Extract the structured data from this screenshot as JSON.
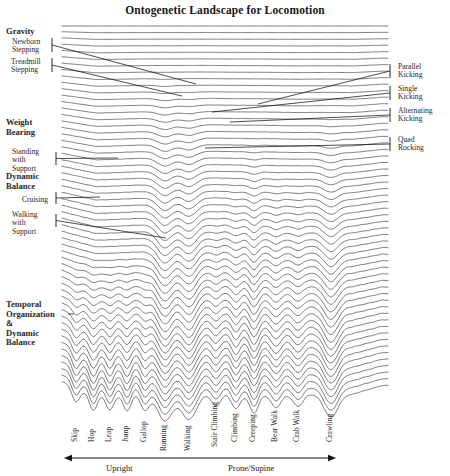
{
  "title": "Ontogenetic Landscape for Locomotion",
  "colors": {
    "line": "#2b2b2b",
    "text": "#1a1a1a",
    "background": "#ffffff",
    "leader": "#111111"
  },
  "left_annotations": [
    {
      "name": "gravity",
      "text": "Gravity",
      "bold": true,
      "x": 6,
      "y": 27,
      "bracket": false
    },
    {
      "name": "newborn-stepping",
      "text": "Newborn\nStepping",
      "bold": false,
      "x": 12,
      "y": 38,
      "bracket": true,
      "bracket_x": 52,
      "bracket_y": 38,
      "bracket_h": 14,
      "leader_to_x": 196,
      "leader_to_y": 84
    },
    {
      "name": "treadmill-stepping",
      "text": "Treadmill\nStepping",
      "bold": false,
      "x": 11,
      "y": 58,
      "bracket": true,
      "bracket_x": 52,
      "bracket_y": 58,
      "bracket_h": 14,
      "leader_to_x": 182,
      "leader_to_y": 96
    },
    {
      "name": "weight-bearing",
      "text": "Weight\nBearing",
      "bold": true,
      "x": 6,
      "y": 118,
      "bracket": false
    },
    {
      "name": "standing-with-support",
      "text": "Standing\nwith\nSupport",
      "bold": false,
      "x": 12,
      "y": 148,
      "bracket": true,
      "bracket_x": 56,
      "bracket_y": 152,
      "bracket_h": 13,
      "leader_to_x": 118,
      "leader_to_y": 158
    },
    {
      "name": "dynamic-balance",
      "text": "Dynamic\nBalance",
      "bold": true,
      "x": 6,
      "y": 172,
      "bracket": false
    },
    {
      "name": "cruising",
      "text": "Cruising",
      "bold": false,
      "x": 22,
      "y": 196,
      "bracket": true,
      "bracket_x": 56,
      "bracket_y": 192,
      "bracket_h": 12,
      "leader_to_x": 100,
      "leader_to_y": 197
    },
    {
      "name": "walking-with-support",
      "text": "Walking\nwith\nSupport",
      "bold": false,
      "x": 12,
      "y": 211,
      "bracket": true,
      "bracket_x": 56,
      "bracket_y": 214,
      "bracket_h": 13,
      "leader_to_x": 166,
      "leader_to_y": 238
    },
    {
      "name": "temporal-organization",
      "text": "Temporal\nOrganization\n&\nDynamic\nBalance",
      "bold": true,
      "x": 6,
      "y": 300,
      "bracket": false,
      "leader_to_x": 74,
      "leader_to_y": 314
    }
  ],
  "right_annotations": [
    {
      "name": "parallel-kicking",
      "text": "Parallel\nKicking",
      "x": 398,
      "y": 63,
      "bracket_x": 390,
      "bracket_y": 64,
      "bracket_h": 14,
      "leader_to_x": 258,
      "leader_to_y": 104
    },
    {
      "name": "single-kicking",
      "text": "Single\nKicking",
      "x": 398,
      "y": 85,
      "bracket_x": 390,
      "bracket_y": 86,
      "bracket_h": 14,
      "leader_to_x": 212,
      "leader_to_y": 112
    },
    {
      "name": "alternating-kicking",
      "text": "Alternating\nKicking",
      "x": 398,
      "y": 107,
      "bracket_x": 390,
      "bracket_y": 108,
      "bracket_h": 14,
      "leader_to_x": 230,
      "leader_to_y": 122
    },
    {
      "name": "quad-rocking",
      "text": "Quad\nRocking",
      "x": 398,
      "y": 136,
      "bracket_x": 390,
      "bracket_y": 137,
      "bracket_h": 14,
      "leader_to_x": 205,
      "leader_to_y": 148
    }
  ],
  "axis": {
    "left_region": "Upright",
    "right_region": "Prone/Supine",
    "arrow_y": 458,
    "arrow_x0": 64,
    "arrow_x1": 336
  },
  "chart_data": {
    "type": "line",
    "title": "Ontogenetic Landscape for Locomotion",
    "xlabel": "Locomotor pattern (Upright ↔ Prone/Supine)",
    "ylabel": "Developmental time (newborn at top)",
    "categories": [
      "Skip",
      "Hop",
      "Leap",
      "Jump",
      "Gallop",
      "Running",
      "Walking",
      "Stair Climbing",
      "Climbing",
      "Creeping",
      "Bear Walk",
      "Crab Walk",
      "Crawling"
    ],
    "category_x": [
      76,
      93,
      110,
      127,
      145,
      165,
      189,
      216,
      236,
      254,
      276,
      298,
      331
    ],
    "attractor_depth": [
      0.55,
      0.62,
      0.58,
      0.62,
      0.6,
      1.0,
      0.95,
      0.45,
      0.55,
      0.7,
      0.5,
      0.45,
      0.85
    ],
    "attractor_onset_row": [
      34,
      34,
      34,
      34,
      34,
      6,
      8,
      26,
      22,
      16,
      20,
      22,
      12
    ],
    "n_rows": 56,
    "row_spacing_px": 6.7,
    "x_range": [
      62,
      388
    ],
    "y_range": [
      26,
      396
    ],
    "grid": false,
    "legend": "none",
    "left_markers": [
      "Gravity",
      "Newborn Stepping",
      "Treadmill Stepping",
      "Weight Bearing",
      "Standing with Support",
      "Dynamic Balance",
      "Cruising",
      "Walking with Support",
      "Temporal Organization & Dynamic Balance"
    ],
    "right_markers": [
      "Parallel Kicking",
      "Single Kicking",
      "Alternating Kicking",
      "Quad Rocking"
    ]
  }
}
